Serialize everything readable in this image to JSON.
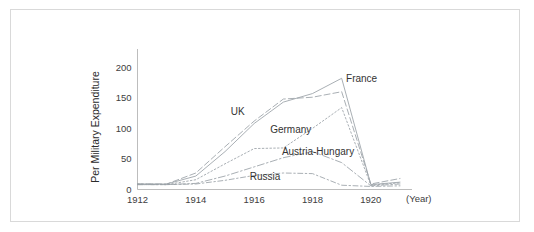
{
  "figure": {
    "background_color": "#ffffff",
    "frame_color": "#d9d9d9",
    "axis_color": "#b5b5b5"
  },
  "chart_data": {
    "type": "line",
    "title": "",
    "xlabel": "(Year)",
    "ylabel": "Per Military Expenditure",
    "xlim": [
      1912,
      1921
    ],
    "ylim": [
      0,
      225
    ],
    "yticks": [
      0,
      50,
      100,
      150,
      200
    ],
    "ytick_labels": [
      "0",
      "50",
      "100",
      "150",
      "200"
    ],
    "xticks": [
      1912,
      1914,
      1916,
      1918,
      1920
    ],
    "xtick_labels": [
      "1912",
      "1914",
      "1916",
      "1918",
      "1920"
    ],
    "grid": false,
    "legend_position": "inline-annotations",
    "x": [
      1912,
      1913,
      1914,
      1915,
      1916,
      1917,
      1918,
      1919,
      1920,
      1921
    ],
    "series": [
      {
        "name": "France",
        "label": "France",
        "color": "#9aa0a6",
        "dash": "none",
        "values": [
          9,
          9,
          22,
          62,
          108,
          143,
          157,
          182,
          8,
          12
        ],
        "label_x": 1919.15,
        "label_y": 176
      },
      {
        "name": "UK",
        "label": "UK",
        "color": "#9aa0a6",
        "dash": "6,3",
        "values": [
          9,
          9,
          27,
          70,
          112,
          148,
          151,
          160,
          9,
          18
        ],
        "label_x": 1915.2,
        "label_y": 122
      },
      {
        "name": "Germany",
        "label": "Germany",
        "color": "#9aa0a6",
        "dash": "1.6,2.2",
        "values": [
          9,
          8,
          16,
          42,
          67,
          68,
          100,
          134,
          7,
          11
        ],
        "label_x": 1916.55,
        "label_y": 93
      },
      {
        "name": "Austria-Hungary",
        "label": "Austria-Hungary",
        "color": "#9aa0a6",
        "dash": "7,2.5,1.6,2.5",
        "values": [
          8,
          8,
          10,
          22,
          37,
          52,
          62,
          44,
          6,
          9
        ],
        "label_x": 1916.95,
        "label_y": 57
      },
      {
        "name": "Russia",
        "label": "Russia",
        "color": "#9aa0a6",
        "dash": "5,2.5,1.5,2.5",
        "values": [
          8,
          8,
          9,
          15,
          23,
          27,
          26,
          7,
          5,
          6
        ],
        "label_x": 1915.85,
        "label_y": 16
      }
    ]
  }
}
